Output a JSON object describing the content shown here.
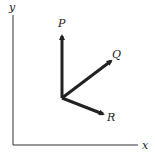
{
  "diagram": {
    "type": "vector-diagram",
    "axes": {
      "x_label": "x",
      "y_label": "y"
    },
    "vectors": [
      {
        "label": "P",
        "direction": "up"
      },
      {
        "label": "Q",
        "direction": "up-right"
      },
      {
        "label": "R",
        "direction": "down-right"
      }
    ],
    "colors": {
      "ink": "#222222",
      "background": "#ffffff"
    }
  }
}
